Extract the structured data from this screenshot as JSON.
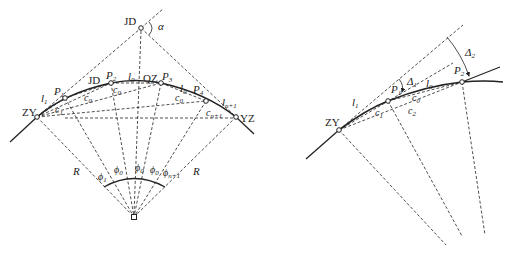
{
  "colors": {
    "ink": "#222222",
    "background": "#ffffff"
  },
  "left_diagram": {
    "points": {
      "JD_top": "JD",
      "ZY": "ZY",
      "YZ": "YZ",
      "QZ": "QZ",
      "JD_mid": "JD",
      "P1": "P",
      "P1_sub": "1",
      "P2": "P",
      "P2_sub": "2",
      "P3": "P",
      "P3_sub": "3",
      "P4": "P",
      "P4_sub": "4"
    },
    "angle_alpha": "α",
    "arc_lengths": {
      "l1": "l",
      "l1_sub": "1",
      "l0_a": "l",
      "l0_a_sub": "0",
      "l0_b": "l",
      "l0_b_sub": "0",
      "ln1": "l",
      "ln1_sub": "n+1"
    },
    "chords": {
      "c0_a": "c",
      "c0_a_sub": "0",
      "c0_b": "c",
      "c0_b_sub": "0",
      "c0_c": "c",
      "c0_c_sub": "0",
      "c1": "c",
      "c1_sub": "1",
      "cn1": "c",
      "cn1_sub": "n+1"
    },
    "radius_labels": {
      "left": "R",
      "right": "R"
    },
    "central_angles": {
      "phi1": "ϕ",
      "phi1_sub": "1",
      "phi0_a": "ϕ",
      "phi0_a_sub": "0",
      "phi0_b": "ϕ",
      "phi0_b_sub": "0",
      "phi0_c": "ϕ",
      "phi0_c_sub": "0",
      "phin1": "ϕ",
      "phin1_sub": "n+1"
    }
  },
  "right_diagram": {
    "points": {
      "ZY": "ZY",
      "P1": "P",
      "P1_sub": "1",
      "P2": "P",
      "P2_sub": "2"
    },
    "arc_lengths": {
      "l1": "l",
      "l1_sub": "1",
      "l0": "l",
      "l0_sub": "0"
    },
    "chords": {
      "c1": "c",
      "c1_sub": "1",
      "c0": "c",
      "c0_sub": "0",
      "c2": "c",
      "c2_sub": "2"
    },
    "deflection_angles": {
      "d1": "Δ",
      "d1_sub": "1",
      "d2": "Δ",
      "d2_sub": "2"
    }
  }
}
